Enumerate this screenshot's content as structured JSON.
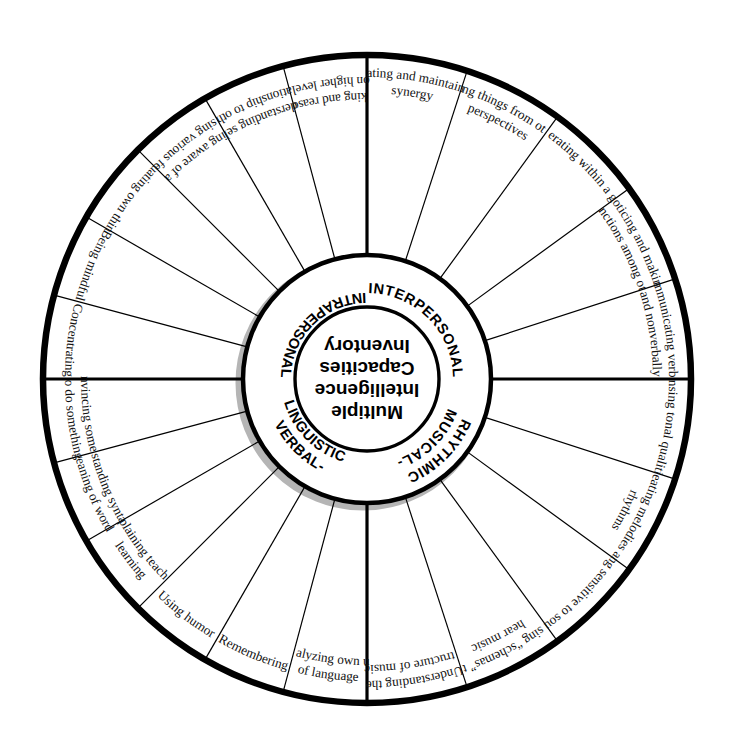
{
  "diagram": {
    "center_lines": [
      "Multiple",
      "Intelligence",
      "Capacities",
      "Inventory"
    ],
    "colors": {
      "ink": "#111111",
      "outline": "#000000",
      "shadow": "#b5b5b5",
      "background": "#ffffff"
    },
    "geometry": {
      "cx": 367,
      "cy": 379,
      "r_center": 72,
      "r_quadrant": 124,
      "r_outer": 324,
      "segment_count": 22
    },
    "quadrants": [
      {
        "id": "intrapersonal",
        "label": "INTRAPERSONAL",
        "label_lines": [
          "INTRAPERSONAL"
        ],
        "start_deg": 180,
        "end_deg": 270,
        "segments": [
          {
            "lines": [
              "Concentrating"
            ]
          },
          {
            "lines": [
              "Being mindful"
            ]
          },
          {
            "lines": [
              "Evaluating own thinking"
            ]
          },
          {
            "lines": [
              "Being aware of and",
              "expressing various feelings"
            ]
          },
          {
            "lines": [
              "Understanding self in",
              "relationship to others"
            ]
          },
          {
            "lines": [
              "Thinking and reasoning",
              "on higher levels"
            ]
          }
        ]
      },
      {
        "id": "interpersonal",
        "label": "INTERPERSONAL",
        "label_lines": [
          "INTERPERSONAL"
        ],
        "start_deg": 270,
        "end_deg": 360,
        "segments": [
          {
            "lines": [
              "Creating and maintaining",
              "synergy"
            ]
          },
          {
            "lines": [
              "Seeing things from others'",
              "perspectives"
            ]
          },
          {
            "lines": [
              "Cooperating within a group"
            ]
          },
          {
            "lines": [
              "Noticing and making",
              "distinctions among others"
            ]
          },
          {
            "lines": [
              "Communicating verbally",
              "and nonverbally"
            ]
          }
        ]
      },
      {
        "id": "musical-rhythmic",
        "label": "MUSICAL-RHYTHMIC",
        "label_lines": [
          "MUSICAL-",
          "RHYTHMIC"
        ],
        "start_deg": 0,
        "end_deg": 90,
        "segments": [
          {
            "lines": [
              "Sensing tonal qualities"
            ]
          },
          {
            "lines": [
              "Creating melodies and",
              "rhythms"
            ]
          },
          {
            "lines": [
              "Being sensitive to sounds"
            ]
          },
          {
            "lines": [
              "Using “schemas” to",
              "hear music"
            ]
          },
          {
            "lines": [
              "Understanding the",
              "structure of music"
            ]
          }
        ]
      },
      {
        "id": "verbal-linguistic",
        "label": "VERBAL-LINGUISTIC",
        "label_lines": [
          "VERBAL-",
          "LINGUISTIC"
        ],
        "start_deg": 90,
        "end_deg": 180,
        "segments": [
          {
            "lines": [
              "Analyzing own use",
              "of language"
            ]
          },
          {
            "lines": [
              "Remembering"
            ]
          },
          {
            "lines": [
              "Using humor"
            ]
          },
          {
            "lines": [
              "Explaining teaching",
              "learning"
            ]
          },
          {
            "lines": [
              "Understanding syntax and",
              "meaning of words"
            ]
          },
          {
            "lines": [
              "Convincing someone",
              "to do something"
            ]
          }
        ]
      }
    ]
  }
}
